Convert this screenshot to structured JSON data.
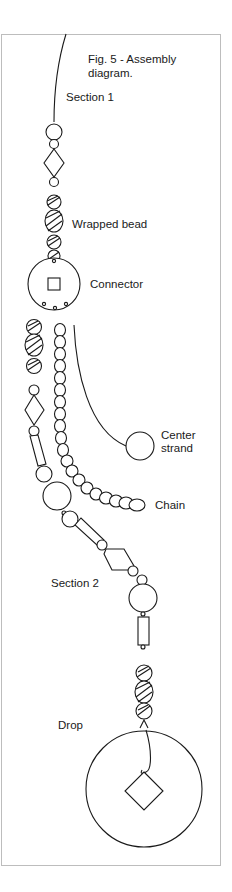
{
  "figure": {
    "title_line1": "Fig. 5 - Assembly",
    "title_line2": "diagram."
  },
  "labels": {
    "section1": "Section 1",
    "wrapped_bead": "Wrapped bead",
    "connector": "Connector",
    "center_strand_line1": "Center",
    "center_strand_line2": "strand",
    "chain": "Chain",
    "section2": "Section 2",
    "drop": "Drop"
  },
  "colors": {
    "line": "#1a1a1a",
    "frame": "#bdbdbd",
    "background": "#ffffff"
  }
}
